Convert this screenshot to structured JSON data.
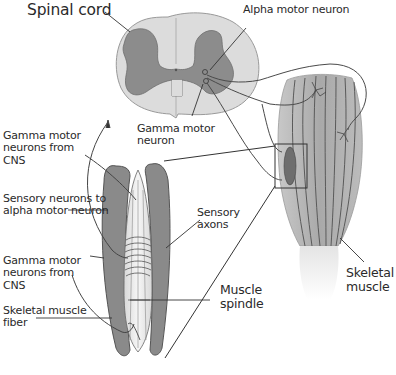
{
  "diagram": {
    "labels": {
      "spinal_cord": "Spinal cord",
      "alpha_motor_neuron": "Alpha motor neuron",
      "gamma_motor_neuron": "Gamma motor\nneuron",
      "gamma_motor_neurons_top": "Gamma motor\nneurons from\nCNS",
      "sensory_neurons": "Sensory neurons to\nalpha motor neuron",
      "sensory_axons": "Sensory\naxons",
      "gamma_motor_neurons_bottom": "Gamma motor\nneurons from\nCNS",
      "skeletal_muscle_fiber": "Skeletal muscle\nfiber",
      "muscle_spindle": "Muscle\nspindle",
      "skeletal_muscle": "Skeletal\nmuscle"
    },
    "colors": {
      "white_matter": "#dcdcdc",
      "gray_matter": "#8c8c8c",
      "spindle_capsule": "#8a8a8a",
      "spindle_inner": "#ececec",
      "muscle_body": "#b4b4b4",
      "muscle_stripe": "#5a5a5a",
      "tendon": "#f0f0f0",
      "line": "#333333"
    }
  }
}
